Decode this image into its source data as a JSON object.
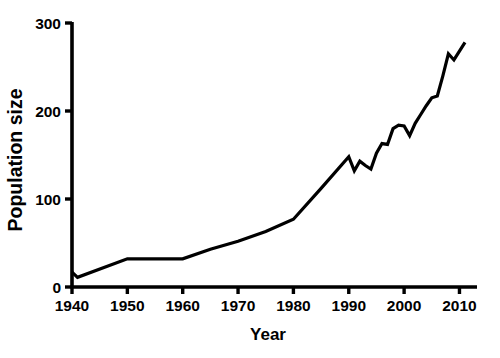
{
  "figure": {
    "top_partial_caption": "2.2   Population dataset",
    "background_color": "#ffffff",
    "line_color": "#000000",
    "axis_color": "#000000"
  },
  "chart_data": {
    "type": "line",
    "title": "",
    "xlabel": "Year",
    "ylabel": "Population size",
    "xlim": [
      1940,
      2011
    ],
    "ylim": [
      0,
      300
    ],
    "xticks": [
      1940,
      1950,
      1960,
      1970,
      1980,
      1990,
      2000,
      2010
    ],
    "xticklabels": [
      "1940",
      "1950",
      "1960",
      "1970",
      "1980",
      "1990",
      "2000",
      "2010"
    ],
    "yticks": [
      0,
      100,
      200,
      300
    ],
    "yticklabels": [
      "0",
      "100",
      "200",
      "300"
    ],
    "grid": false,
    "legend": false,
    "series": [
      {
        "name": "Population size",
        "x": [
          1940,
          1941,
          1950,
          1960,
          1965,
          1970,
          1975,
          1980,
          1985,
          1990,
          1991,
          1992,
          1993,
          1994,
          1995,
          1996,
          1997,
          1998,
          1999,
          2000,
          2001,
          2002,
          2003,
          2004,
          2005,
          2006,
          2007,
          2008,
          2009,
          2010,
          2011
        ],
        "y": [
          17,
          11,
          32,
          32,
          43,
          52,
          63,
          77,
          112,
          148,
          132,
          143,
          138,
          134,
          152,
          163,
          162,
          180,
          184,
          183,
          172,
          186,
          196,
          206,
          215,
          217,
          240,
          265,
          258,
          268,
          278
        ]
      }
    ]
  }
}
